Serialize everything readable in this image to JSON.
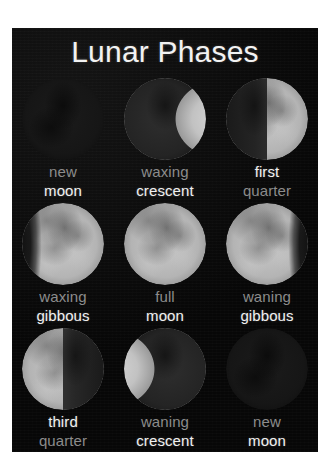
{
  "poster": {
    "title": "Lunar Phases",
    "background_color": "#0a0a0a",
    "title_color": "#f2f2f2",
    "bright_label_color": "#f0f0f0",
    "dim_label_color": "#8c8c8c"
  },
  "phases": [
    {
      "line1": "new",
      "line2": "moon",
      "line1_style": "dim",
      "line2_style": "bright",
      "illumination": "none",
      "lit_side": "none"
    },
    {
      "line1": "waxing",
      "line2": "crescent",
      "line1_style": "dim",
      "line2_style": "bright",
      "illumination": "crescent",
      "lit_side": "right"
    },
    {
      "line1": "first",
      "line2": "quarter",
      "line1_style": "bright",
      "line2_style": "dim",
      "illumination": "half",
      "lit_side": "right"
    },
    {
      "line1": "waxing",
      "line2": "gibbous",
      "line1_style": "dim",
      "line2_style": "bright",
      "illumination": "gibbous",
      "lit_side": "right"
    },
    {
      "line1": "full",
      "line2": "moon",
      "line1_style": "dim",
      "line2_style": "bright",
      "illumination": "full",
      "lit_side": "both"
    },
    {
      "line1": "waning",
      "line2": "gibbous",
      "line1_style": "dim",
      "line2_style": "bright",
      "illumination": "gibbous",
      "lit_side": "left"
    },
    {
      "line1": "third",
      "line2": "quarter",
      "line1_style": "bright",
      "line2_style": "dim",
      "illumination": "half",
      "lit_side": "left"
    },
    {
      "line1": "waning",
      "line2": "crescent",
      "line1_style": "dim",
      "line2_style": "bright",
      "illumination": "crescent",
      "lit_side": "left"
    },
    {
      "line1": "new",
      "line2": "moon",
      "line1_style": "dim",
      "line2_style": "bright",
      "illumination": "none",
      "lit_side": "none"
    }
  ]
}
